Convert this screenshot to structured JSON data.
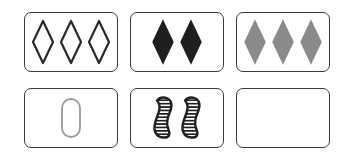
{
  "board": {
    "name": "set-card-layout",
    "background_color": "#ffffff",
    "card_border_color": "#3b3b3b",
    "card_fill_color": "#ffffff",
    "rows": 2,
    "columns": 3,
    "total_cards": 6
  },
  "palette": {
    "black": "#1f1f1f",
    "gray": "#8a8a8a",
    "light_gray": "#9a9a9a",
    "stripe": "#1f1f1f",
    "white": "#ffffff"
  },
  "cards": [
    {
      "id": "card-1",
      "position": "row-1-col-1",
      "count": 3,
      "shape": "diamond",
      "shading": "open",
      "color": "#2a2a2a",
      "fill": "none",
      "label": "three open dark diamonds",
      "empty": false
    },
    {
      "id": "card-2",
      "position": "row-1-col-2",
      "count": 2,
      "shape": "diamond",
      "shading": "solid",
      "color": "#1f1f1f",
      "fill": "#1f1f1f",
      "label": "two solid black diamonds",
      "empty": false
    },
    {
      "id": "card-3",
      "position": "row-1-col-3",
      "count": 3,
      "shape": "diamond",
      "shading": "solid",
      "color": "#8a8a8a",
      "fill": "#8a8a8a",
      "label": "three solid gray diamonds",
      "empty": false
    },
    {
      "id": "card-4",
      "position": "row-2-col-1",
      "count": 1,
      "shape": "pill",
      "shading": "open",
      "color": "#9a9a9a",
      "fill": "none",
      "label": "one open gray pill",
      "empty": false
    },
    {
      "id": "card-5",
      "position": "row-2-col-2",
      "count": 2,
      "shape": "squiggle",
      "shading": "striped",
      "color": "#1f1f1f",
      "fill": "striped",
      "label": "two striped black squiggles",
      "empty": false
    },
    {
      "id": "card-6",
      "position": "row-2-col-3",
      "count": 0,
      "shape": "none",
      "shading": "none",
      "color": "#ffffff",
      "fill": "none",
      "label": "empty card",
      "empty": true
    }
  ]
}
